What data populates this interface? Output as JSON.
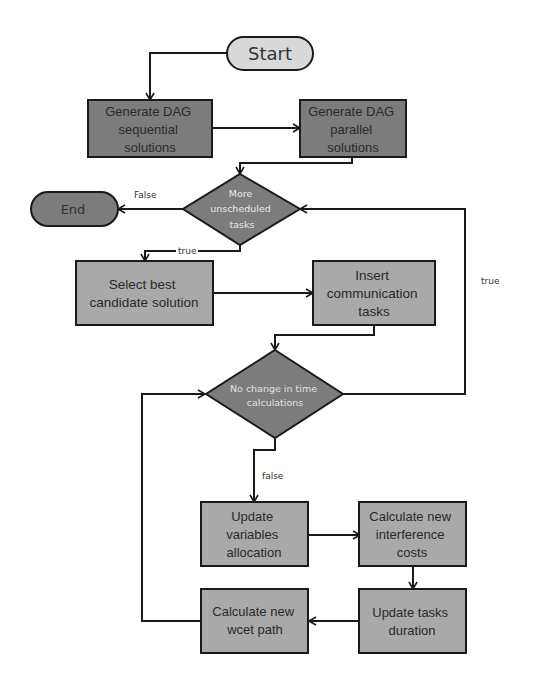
{
  "diagram": {
    "type": "flowchart",
    "colors": {
      "dark_fill": "#7c7c7c",
      "mid_fill": "#a9a9a9",
      "light_fill": "#d9d9d9",
      "stroke": "#1a1a1a",
      "background": "#ffffff"
    },
    "nodes": {
      "start": {
        "label": "Start"
      },
      "gen_seq": {
        "lines": [
          "Generate DAG",
          "sequential",
          "solutions"
        ]
      },
      "gen_par": {
        "lines": [
          "Generate DAG",
          "parallel",
          "solutions"
        ]
      },
      "more_tasks": {
        "lines": [
          "More",
          "unscheduled",
          "tasks"
        ]
      },
      "end": {
        "label": "End"
      },
      "select_best": {
        "lines": [
          "Select best",
          "candidate solution"
        ]
      },
      "insert_comm": {
        "lines": [
          "Insert",
          "communication",
          "tasks"
        ]
      },
      "no_change": {
        "lines": [
          "No change in time",
          "calculations"
        ]
      },
      "update_vars": {
        "lines": [
          "Update",
          "variables",
          "allocation"
        ]
      },
      "calc_interf": {
        "lines": [
          "Calculate new",
          "interference",
          "costs"
        ]
      },
      "update_dur": {
        "lines": [
          "Update tasks",
          "duration"
        ]
      },
      "calc_wcet": {
        "lines": [
          "Calculate new",
          "wcet path"
        ]
      }
    },
    "edge_labels": {
      "false_to_end": "False",
      "true_to_select": "true",
      "true_loop_back": "true",
      "false_to_update": "false"
    }
  }
}
